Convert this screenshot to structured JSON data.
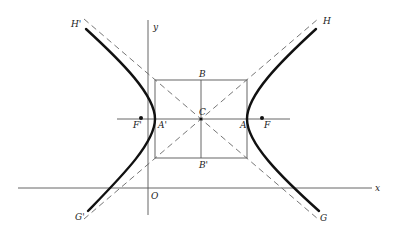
{
  "diagram": {
    "type": "hyperbola",
    "labels": {
      "x_axis": "x",
      "y_axis": "y",
      "origin": "O",
      "center": "C",
      "vertex_right": "A",
      "vertex_left": "A'",
      "focus_right": "F",
      "focus_left": "F'",
      "conj_top": "B",
      "conj_bottom": "B'",
      "asym_top_right": "H",
      "asym_top_left": "H'",
      "asym_bottom_right": "G",
      "asym_bottom_left": "G'"
    },
    "geometry": {
      "center": [
        201,
        119
      ],
      "a": 46,
      "b": 39,
      "foci_x": [
        141,
        262
      ],
      "x_axis_y": 188,
      "y_axis_x": 148
    },
    "colors": {
      "curve": "#111111",
      "lines": "#555555",
      "asymptotes": "#666666"
    }
  }
}
